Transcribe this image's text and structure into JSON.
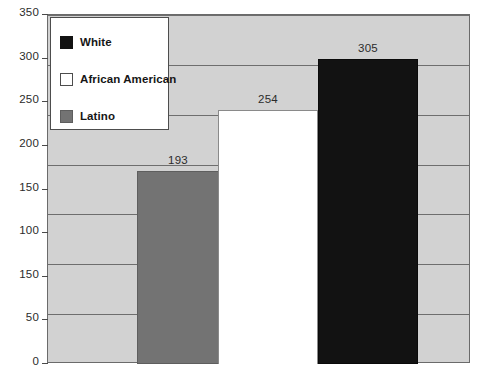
{
  "chart_data": {
    "type": "bar",
    "title": "",
    "subtitle": "",
    "xlabel": "",
    "ylabel": "",
    "categories": [
      "Latino",
      "African American",
      "White"
    ],
    "values": [
      193,
      254,
      305
    ],
    "data_labels": [
      "193",
      "254",
      "305"
    ],
    "ylim": [
      0,
      350
    ],
    "grid": true,
    "grid_axis": "y",
    "legend_position": "top-left",
    "y_tick_values": [
      350,
      300,
      250,
      200,
      150,
      100,
      100,
      50,
      0
    ],
    "y_tick_labels": [
      "350",
      "300",
      "250",
      "200",
      "150",
      "100",
      "150",
      "50",
      "0"
    ],
    "x_tick_labels": [],
    "series": [
      {
        "name": "Latino",
        "value": 193,
        "color": "#737373"
      },
      {
        "name": "African American",
        "value": 254,
        "color": "#ffffff"
      },
      {
        "name": "White",
        "value": 305,
        "color": "#121212"
      }
    ],
    "note_axis_label_anomaly": "seventh tick reads 150 instead of 100 in the source image"
  },
  "legend": {
    "items": [
      {
        "label": "White",
        "swatch": "black-swatch-icon"
      },
      {
        "label": "African American",
        "swatch": "white-swatch-icon"
      },
      {
        "label": "Latino",
        "swatch": "gray-swatch-icon"
      }
    ]
  },
  "colors": {
    "plot_background": "#d2d2d2",
    "page_background": "#ffffff",
    "gridline": "#6e6e6e",
    "frame": "#6b6b6b",
    "bar_latino": "#737373",
    "bar_african_american": "#ffffff",
    "bar_white": "#121212",
    "text": "#2b2b2b"
  }
}
